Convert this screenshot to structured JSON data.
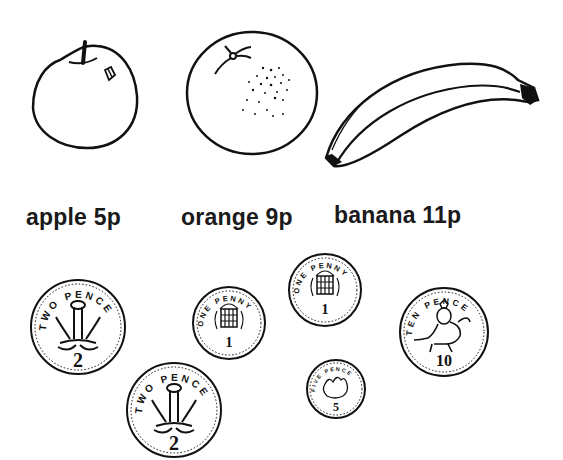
{
  "fruits": [
    {
      "name": "apple",
      "label": "apple 5p",
      "price_pence": 5
    },
    {
      "name": "orange",
      "label": "orange 9p",
      "price_pence": 9
    },
    {
      "name": "banana",
      "label": "banana 11p",
      "price_pence": 11
    }
  ],
  "coins": [
    {
      "id": "two-pence-1",
      "inscription": "TWO PENCE",
      "value": "2"
    },
    {
      "id": "two-pence-2",
      "inscription": "TWO PENCE",
      "value": "2"
    },
    {
      "id": "one-penny-1",
      "inscription": "ONE PENNY",
      "value": "1"
    },
    {
      "id": "one-penny-2",
      "inscription": "ONE PENNY",
      "value": "1"
    },
    {
      "id": "five-pence",
      "inscription": "FIVE PENCE",
      "value": "5"
    },
    {
      "id": "ten-pence",
      "inscription": "TEN PENCE",
      "value": "10"
    }
  ],
  "colors": {
    "ink": "#111111",
    "background": "#ffffff"
  }
}
